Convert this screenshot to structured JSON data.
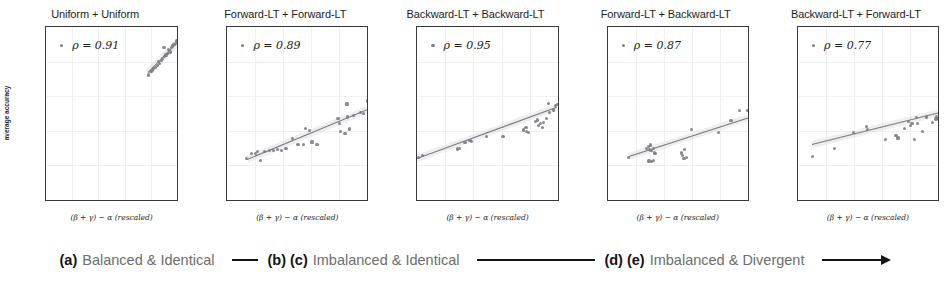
{
  "figure": {
    "ylabel": "average accuracy",
    "xlabel_prefix": "(",
    "xlabel_math": "β + γ) − α",
    "xlabel_suffix": " (rescaled)",
    "xlabel_full": "(β + γ) − α (rescaled)",
    "rho_symbol": "ρ =",
    "marker_color": "#7d7f86",
    "line_color": "#6f7176",
    "band_color": "#d9dadd",
    "axis_color": "#3a3a3a",
    "caption_text_color": "#6d6d6d",
    "caption_tag_color": "#141414"
  },
  "axes": {
    "xticks": [
      "0.0",
      "0.2",
      "0.4",
      "0.6",
      "0.8",
      "1.0"
    ],
    "yticks": [
      "0.0",
      "0.2",
      "0.4",
      "0.6",
      "0.8",
      "1.0"
    ],
    "xlim": [
      0.0,
      1.0
    ],
    "ylim": [
      0.0,
      1.0
    ]
  },
  "chart_data": [
    {
      "type": "scatter",
      "title": "Uniform + Uniform",
      "rho_label": "ρ = 0.91",
      "rho": 0.91,
      "xlabel": "(β + γ) − α (rescaled)",
      "ylabel": "average accuracy",
      "xlim": [
        0.0,
        1.0
      ],
      "ylim": [
        0.0,
        1.0
      ],
      "grid": true,
      "legend_position": "upper-left",
      "fit_line": {
        "x0": 0.78,
        "y0": 0.735,
        "x1": 1.0,
        "y1": 0.905
      },
      "points": [
        {
          "x": 0.78,
          "y": 0.723
        },
        {
          "x": 0.8,
          "y": 0.742
        },
        {
          "x": 0.81,
          "y": 0.748
        },
        {
          "x": 0.822,
          "y": 0.76
        },
        {
          "x": 0.835,
          "y": 0.768
        },
        {
          "x": 0.848,
          "y": 0.778
        },
        {
          "x": 0.855,
          "y": 0.8
        },
        {
          "x": 0.862,
          "y": 0.79
        },
        {
          "x": 0.878,
          "y": 0.808
        },
        {
          "x": 0.89,
          "y": 0.818
        },
        {
          "x": 0.9,
          "y": 0.88
        },
        {
          "x": 0.905,
          "y": 0.828
        },
        {
          "x": 0.915,
          "y": 0.838
        },
        {
          "x": 0.925,
          "y": 0.846
        },
        {
          "x": 0.935,
          "y": 0.87
        },
        {
          "x": 0.945,
          "y": 0.855
        },
        {
          "x": 0.955,
          "y": 0.88
        },
        {
          "x": 0.965,
          "y": 0.89
        },
        {
          "x": 0.975,
          "y": 0.898
        },
        {
          "x": 0.985,
          "y": 0.906
        },
        {
          "x": 0.992,
          "y": 0.915
        },
        {
          "x": 0.998,
          "y": 0.922
        }
      ]
    },
    {
      "type": "scatter",
      "title": "Forward-LT + Forward-LT",
      "rho_label": "ρ = 0.89",
      "rho": 0.89,
      "xlabel": "(β + γ) − α (rescaled)",
      "ylabel": "average accuracy",
      "xlim": [
        0.0,
        1.0
      ],
      "ylim": [
        0.0,
        1.0
      ],
      "grid": true,
      "legend_position": "upper-left",
      "fit_line": {
        "x0": 0.14,
        "y0": 0.232,
        "x1": 1.0,
        "y1": 0.52
      },
      "points": [
        {
          "x": 0.14,
          "y": 0.238
        },
        {
          "x": 0.175,
          "y": 0.268
        },
        {
          "x": 0.2,
          "y": 0.27
        },
        {
          "x": 0.215,
          "y": 0.278
        },
        {
          "x": 0.24,
          "y": 0.23
        },
        {
          "x": 0.265,
          "y": 0.282
        },
        {
          "x": 0.3,
          "y": 0.285
        },
        {
          "x": 0.33,
          "y": 0.286
        },
        {
          "x": 0.36,
          "y": 0.293
        },
        {
          "x": 0.385,
          "y": 0.288
        },
        {
          "x": 0.42,
          "y": 0.3
        },
        {
          "x": 0.465,
          "y": 0.355
        },
        {
          "x": 0.505,
          "y": 0.322
        },
        {
          "x": 0.545,
          "y": 0.32
        },
        {
          "x": 0.56,
          "y": 0.415
        },
        {
          "x": 0.585,
          "y": 0.4
        },
        {
          "x": 0.605,
          "y": 0.335
        },
        {
          "x": 0.64,
          "y": 0.32
        },
        {
          "x": 0.79,
          "y": 0.47
        },
        {
          "x": 0.8,
          "y": 0.44
        },
        {
          "x": 0.81,
          "y": 0.395
        },
        {
          "x": 0.84,
          "y": 0.385
        },
        {
          "x": 0.855,
          "y": 0.555
        },
        {
          "x": 0.86,
          "y": 0.48
        },
        {
          "x": 0.87,
          "y": 0.41
        },
        {
          "x": 0.9,
          "y": 0.49
        },
        {
          "x": 0.95,
          "y": 0.505
        },
        {
          "x": 0.97,
          "y": 0.5
        },
        {
          "x": 1.0,
          "y": 0.572
        }
      ]
    },
    {
      "type": "scatter",
      "title": "Backward-LT + Backward-LT",
      "rho_label": "ρ = 0.95",
      "rho": 0.95,
      "xlabel": "(β + γ) − α (rescaled)",
      "ylabel": "average accuracy",
      "xlim": [
        0.0,
        1.0
      ],
      "ylim": [
        0.0,
        1.0
      ],
      "grid": true,
      "legend_position": "upper-left",
      "fit_line": {
        "x0": 0.0,
        "y0": 0.238,
        "x1": 1.0,
        "y1": 0.535
      },
      "points": [
        {
          "x": 0.005,
          "y": 0.248
        },
        {
          "x": 0.035,
          "y": 0.255
        },
        {
          "x": 0.285,
          "y": 0.295
        },
        {
          "x": 0.3,
          "y": 0.3
        },
        {
          "x": 0.34,
          "y": 0.332
        },
        {
          "x": 0.375,
          "y": 0.345
        },
        {
          "x": 0.385,
          "y": 0.34
        },
        {
          "x": 0.495,
          "y": 0.368
        },
        {
          "x": 0.61,
          "y": 0.368
        },
        {
          "x": 0.755,
          "y": 0.405
        },
        {
          "x": 0.775,
          "y": 0.418
        },
        {
          "x": 0.78,
          "y": 0.395
        },
        {
          "x": 0.79,
          "y": 0.39
        },
        {
          "x": 0.84,
          "y": 0.455
        },
        {
          "x": 0.855,
          "y": 0.462
        },
        {
          "x": 0.865,
          "y": 0.43
        },
        {
          "x": 0.88,
          "y": 0.44
        },
        {
          "x": 0.89,
          "y": 0.418
        },
        {
          "x": 0.9,
          "y": 0.448
        },
        {
          "x": 0.92,
          "y": 0.47
        },
        {
          "x": 0.935,
          "y": 0.558
        },
        {
          "x": 0.945,
          "y": 0.505
        },
        {
          "x": 0.97,
          "y": 0.52
        },
        {
          "x": 0.985,
          "y": 0.548
        },
        {
          "x": 1.0,
          "y": 0.552
        }
      ]
    },
    {
      "type": "scatter",
      "title": "Forward-LT + Backward-LT",
      "rho_label": "ρ = 0.87",
      "rho": 0.87,
      "xlabel": "(β + γ) − α (rescaled)",
      "ylabel": "average accuracy",
      "xlim": [
        0.0,
        1.0
      ],
      "ylim": [
        0.0,
        1.0
      ],
      "grid": true,
      "legend_position": "upper-left",
      "fit_line": {
        "x0": 0.15,
        "y0": 0.252,
        "x1": 1.0,
        "y1": 0.475
      },
      "points": [
        {
          "x": 0.15,
          "y": 0.248
        },
        {
          "x": 0.28,
          "y": 0.298
        },
        {
          "x": 0.29,
          "y": 0.31
        },
        {
          "x": 0.295,
          "y": 0.225
        },
        {
          "x": 0.3,
          "y": 0.29
        },
        {
          "x": 0.305,
          "y": 0.318
        },
        {
          "x": 0.31,
          "y": 0.285
        },
        {
          "x": 0.315,
          "y": 0.222
        },
        {
          "x": 0.325,
          "y": 0.23
        },
        {
          "x": 0.33,
          "y": 0.3
        },
        {
          "x": 0.335,
          "y": 0.272
        },
        {
          "x": 0.34,
          "y": 0.268
        },
        {
          "x": 0.525,
          "y": 0.272
        },
        {
          "x": 0.535,
          "y": 0.255
        },
        {
          "x": 0.545,
          "y": 0.24
        },
        {
          "x": 0.55,
          "y": 0.29
        },
        {
          "x": 0.56,
          "y": 0.245
        },
        {
          "x": 0.6,
          "y": 0.408
        },
        {
          "x": 0.79,
          "y": 0.39
        },
        {
          "x": 0.88,
          "y": 0.458
        },
        {
          "x": 0.94,
          "y": 0.515
        },
        {
          "x": 0.995,
          "y": 0.518
        }
      ]
    },
    {
      "type": "scatter",
      "title": "Backward-LT + Forward-LT",
      "rho_label": "ρ = 0.77",
      "rho": 0.77,
      "xlabel": "(β + γ) − α (rescaled)",
      "ylabel": "average accuracy",
      "xlim": [
        0.0,
        1.0
      ],
      "ylim": [
        0.0,
        1.0
      ],
      "grid": true,
      "legend_position": "upper-left",
      "fit_line": {
        "x0": 0.1,
        "y0": 0.318,
        "x1": 1.0,
        "y1": 0.5
      },
      "points": [
        {
          "x": 0.105,
          "y": 0.252
        },
        {
          "x": 0.26,
          "y": 0.3
        },
        {
          "x": 0.395,
          "y": 0.388
        },
        {
          "x": 0.49,
          "y": 0.425
        },
        {
          "x": 0.495,
          "y": 0.408
        },
        {
          "x": 0.625,
          "y": 0.348
        },
        {
          "x": 0.7,
          "y": 0.372
        },
        {
          "x": 0.715,
          "y": 0.358
        },
        {
          "x": 0.76,
          "y": 0.412
        },
        {
          "x": 0.79,
          "y": 0.455
        },
        {
          "x": 0.805,
          "y": 0.432
        },
        {
          "x": 0.815,
          "y": 0.44
        },
        {
          "x": 0.83,
          "y": 0.352
        },
        {
          "x": 0.845,
          "y": 0.478
        },
        {
          "x": 0.855,
          "y": 0.442
        },
        {
          "x": 0.89,
          "y": 0.398
        },
        {
          "x": 0.915,
          "y": 0.48
        },
        {
          "x": 0.96,
          "y": 0.448
        },
        {
          "x": 0.985,
          "y": 0.468
        },
        {
          "x": 0.99,
          "y": 0.482
        },
        {
          "x": 0.998,
          "y": 0.472
        }
      ]
    }
  ],
  "caption": {
    "segments": [
      {
        "tag": "(a)",
        "text": "Balanced & Identical"
      },
      {
        "tag": "(b) (c)",
        "text": "Imbalanced & Identical"
      },
      {
        "tag": "(d) (e)",
        "text": "Imbalanced & Divergent"
      }
    ]
  }
}
